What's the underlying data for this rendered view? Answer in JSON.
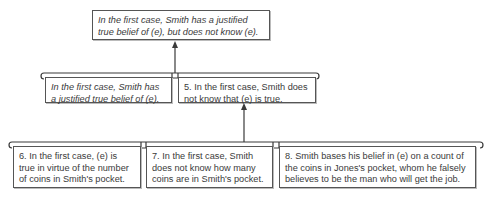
{
  "diagram": {
    "type": "argument-map",
    "conclusion": {
      "text": "In the first case, Smith has a justified true belief of (e), but does not know (e).",
      "italic": true
    },
    "level2": [
      {
        "text": "In the first case, Smith has a justified true belief of (e).",
        "italic": true
      },
      {
        "text": "5. In the first case, Smith does not know that (e) is true.",
        "italic": false
      }
    ],
    "level3": [
      {
        "text": "6. In the first case, (e) is true in virtue of the number of coins in Smith's pocket."
      },
      {
        "text": "7. In the first case, Smith does not know how many coins are in Smith's pocket."
      },
      {
        "text": "8. Smith bases his belief in (e) on a count of the coins in Jones's pocket, whom he falsely believes to be the man who will get the job."
      }
    ],
    "edges": [
      {
        "from": "level2",
        "to": "conclusion",
        "style": "bracket-arrow"
      },
      {
        "from": "level3",
        "to": "level2.1",
        "style": "bracket-arrow"
      }
    ],
    "colors": {
      "line": "#3a3a3a",
      "border": "#555555",
      "text": "#3a3a3a"
    }
  }
}
